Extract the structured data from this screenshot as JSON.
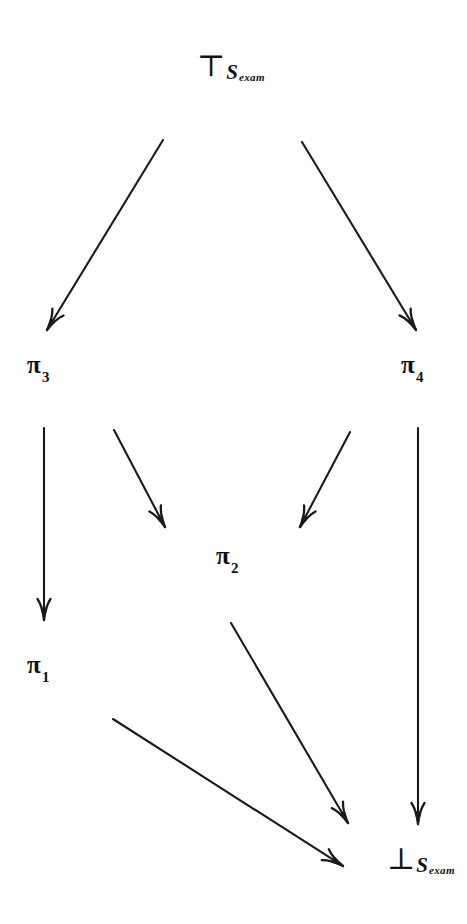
{
  "diagram": {
    "type": "hasse-diagram",
    "width": 467,
    "height": 924,
    "background_color": "#ffffff",
    "line_color": "#1a1a1a",
    "nodes": [
      {
        "id": "top",
        "kind": "tack",
        "glyph": "⊤",
        "glyph_name": "down-tack-top-element",
        "base": "S",
        "subscript": "exam",
        "text": "⊤S_exam",
        "x": 197,
        "y": 55
      },
      {
        "id": "pi3",
        "kind": "pi",
        "symbol": "π",
        "subscript": "3",
        "text": "π₃",
        "x": 27,
        "y": 352
      },
      {
        "id": "pi4",
        "kind": "pi",
        "symbol": "π",
        "subscript": "4",
        "text": "π₄",
        "x": 401,
        "y": 352
      },
      {
        "id": "pi2",
        "kind": "pi",
        "symbol": "π",
        "subscript": "2",
        "text": "π₂",
        "x": 216,
        "y": 543
      },
      {
        "id": "pi1",
        "kind": "pi",
        "symbol": "π",
        "subscript": "1",
        "text": "π₁",
        "x": 27,
        "y": 652
      },
      {
        "id": "bottom",
        "kind": "tack",
        "glyph": "⊥",
        "glyph_name": "up-tack-bottom-element",
        "base": "S",
        "subscript": "exam",
        "text": "⊥S_exam",
        "x": 387,
        "y": 848
      }
    ],
    "edges": [
      {
        "id": "top-to-pi3",
        "from": "top",
        "to": "pi3",
        "x1": 163,
        "y1": 140,
        "x2": 47,
        "y2": 330,
        "arrowhead": "open-barbed"
      },
      {
        "id": "top-to-pi4",
        "from": "top",
        "to": "pi4",
        "x1": 302,
        "y1": 142,
        "x2": 416,
        "y2": 330,
        "arrowhead": "open-barbed"
      },
      {
        "id": "pi3-to-pi1",
        "from": "pi3",
        "to": "pi1",
        "x1": 44,
        "y1": 428,
        "x2": 44,
        "y2": 620,
        "arrowhead": "open-barbed"
      },
      {
        "id": "pi3-to-pi2",
        "from": "pi3",
        "to": "pi2",
        "x1": 114,
        "y1": 430,
        "x2": 165,
        "y2": 527,
        "arrowhead": "open-barbed"
      },
      {
        "id": "pi4-to-pi2",
        "from": "pi4",
        "to": "pi2",
        "x1": 350,
        "y1": 432,
        "x2": 300,
        "y2": 527,
        "arrowhead": "open-barbed"
      },
      {
        "id": "pi4-to-bottom",
        "from": "pi4",
        "to": "bottom",
        "x1": 418,
        "y1": 428,
        "x2": 418,
        "y2": 824,
        "arrowhead": "open-barbed"
      },
      {
        "id": "pi2-to-bottom",
        "from": "pi2",
        "to": "bottom",
        "x1": 231,
        "y1": 623,
        "x2": 348,
        "y2": 823,
        "arrowhead": "open-barbed"
      },
      {
        "id": "pi1-to-bottom",
        "from": "pi1",
        "to": "bottom",
        "x1": 113,
        "y1": 719,
        "x2": 343,
        "y2": 866,
        "arrowhead": "open-barbed"
      }
    ]
  }
}
